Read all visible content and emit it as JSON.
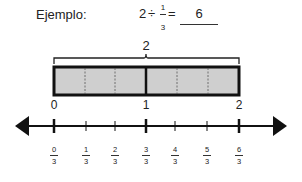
{
  "header": {
    "label": "Ejemplo:",
    "equation": {
      "whole": "2",
      "operator": "÷",
      "numerator": "1",
      "denominator": "3",
      "equals": "="
    },
    "answer": "6"
  },
  "diagram": {
    "brace_label": "2",
    "bar": {
      "segments": 6,
      "fill": "#cfcfcf",
      "whole_units": 2
    },
    "whole_labels": [
      {
        "value": "0",
        "x": 54
      },
      {
        "value": "1",
        "x": 146
      },
      {
        "value": "2",
        "x": 239
      }
    ],
    "number_line": {
      "ticks": [
        {
          "num": "0",
          "den": "3",
          "x": 54
        },
        {
          "num": "1",
          "den": "3",
          "x": 86
        },
        {
          "num": "2",
          "den": "3",
          "x": 115
        },
        {
          "num": "3",
          "den": "3",
          "x": 146
        },
        {
          "num": "4",
          "den": "3",
          "x": 175
        },
        {
          "num": "5",
          "den": "3",
          "x": 207
        },
        {
          "num": "6",
          "den": "3",
          "x": 239
        }
      ]
    }
  }
}
